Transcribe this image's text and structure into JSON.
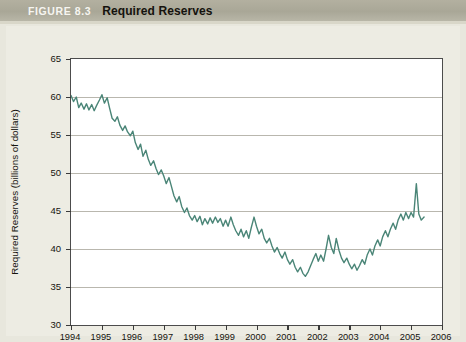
{
  "header": {
    "figure_number": "FIGURE 8.3",
    "title": "Required Reserves"
  },
  "chart_data": {
    "type": "line",
    "title": "Required Reserves",
    "xlabel": "Date",
    "ylabel": "Required Reserves (billions of dollars)",
    "xlim": [
      1994,
      2006
    ],
    "ylim": [
      30,
      65
    ],
    "xticks": [
      "1994",
      "1995",
      "1996",
      "1997",
      "1998",
      "1999",
      "2000",
      "2001",
      "2002",
      "2003",
      "2004",
      "2005",
      "2006"
    ],
    "yticks": [
      30,
      35,
      40,
      45,
      50,
      55,
      60,
      65
    ],
    "grid": true,
    "legend": "none",
    "line_color": "#4a8577",
    "series": [
      {
        "name": "Required Reserves",
        "x": [
          1994.0,
          1994.08,
          1994.17,
          1994.25,
          1994.33,
          1994.42,
          1994.5,
          1994.58,
          1994.67,
          1994.75,
          1994.83,
          1994.92,
          1995.0,
          1995.08,
          1995.17,
          1995.25,
          1995.33,
          1995.42,
          1995.5,
          1995.58,
          1995.67,
          1995.75,
          1995.83,
          1995.92,
          1996.0,
          1996.08,
          1996.17,
          1996.25,
          1996.33,
          1996.42,
          1996.5,
          1996.58,
          1996.67,
          1996.75,
          1996.83,
          1996.92,
          1997.0,
          1997.08,
          1997.17,
          1997.25,
          1997.33,
          1997.42,
          1997.5,
          1997.58,
          1997.67,
          1997.75,
          1997.83,
          1997.92,
          1998.0,
          1998.08,
          1998.17,
          1998.25,
          1998.33,
          1998.42,
          1998.5,
          1998.58,
          1998.67,
          1998.75,
          1998.83,
          1998.92,
          1999.0,
          1999.08,
          1999.17,
          1999.25,
          1999.33,
          1999.42,
          1999.5,
          1999.58,
          1999.67,
          1999.75,
          1999.83,
          1999.92,
          2000.0,
          2000.08,
          2000.17,
          2000.25,
          2000.33,
          2000.42,
          2000.5,
          2000.58,
          2000.67,
          2000.75,
          2000.83,
          2000.92,
          2001.0,
          2001.08,
          2001.17,
          2001.25,
          2001.33,
          2001.42,
          2001.5,
          2001.58,
          2001.67,
          2001.75,
          2001.83,
          2001.92,
          2002.0,
          2002.08,
          2002.17,
          2002.25,
          2002.33,
          2002.42,
          2002.5,
          2002.58,
          2002.67,
          2002.75,
          2002.83,
          2002.92,
          2003.0,
          2003.08,
          2003.17,
          2003.25,
          2003.33,
          2003.42,
          2003.5,
          2003.58,
          2003.67,
          2003.75,
          2003.83,
          2003.92,
          2004.0,
          2004.08,
          2004.17,
          2004.25,
          2004.33,
          2004.42,
          2004.5,
          2004.58,
          2004.67,
          2004.75,
          2004.83,
          2004.92,
          2005.0,
          2005.08,
          2005.17,
          2005.25,
          2005.33,
          2005.42
        ],
        "values": [
          60.2,
          59.4,
          60.0,
          58.6,
          59.2,
          58.4,
          59.1,
          58.3,
          59.0,
          58.2,
          58.9,
          59.6,
          60.3,
          59.2,
          59.9,
          58.5,
          57.2,
          56.8,
          57.4,
          56.3,
          55.6,
          56.2,
          55.4,
          54.9,
          55.5,
          54.0,
          53.1,
          53.8,
          52.2,
          53.0,
          51.8,
          51.0,
          51.6,
          50.6,
          49.8,
          50.4,
          49.6,
          48.6,
          49.4,
          48.2,
          47.0,
          46.2,
          46.9,
          45.6,
          44.8,
          45.4,
          44.4,
          43.8,
          44.4,
          43.6,
          44.3,
          43.2,
          44.0,
          43.3,
          44.1,
          43.4,
          44.2,
          43.5,
          44.0,
          43.0,
          43.8,
          43.0,
          44.2,
          43.2,
          42.4,
          41.8,
          42.6,
          41.6,
          42.4,
          41.4,
          42.8,
          44.2,
          43.0,
          42.0,
          42.6,
          41.4,
          40.8,
          41.4,
          40.4,
          39.6,
          40.2,
          39.4,
          38.8,
          39.6,
          38.6,
          38.0,
          38.6,
          37.6,
          37.0,
          37.6,
          36.8,
          36.4,
          37.0,
          37.8,
          38.6,
          39.4,
          38.4,
          39.2,
          38.4,
          40.0,
          41.8,
          40.2,
          39.4,
          41.4,
          39.8,
          38.8,
          38.2,
          38.8,
          38.0,
          37.4,
          38.0,
          37.2,
          37.8,
          38.6,
          38.0,
          39.2,
          40.0,
          39.2,
          40.4,
          41.2,
          40.4,
          41.6,
          42.4,
          41.6,
          42.6,
          43.4,
          42.6,
          43.8,
          44.6,
          43.8,
          44.8,
          44.0,
          44.8,
          44.2,
          48.6,
          44.6,
          43.8,
          44.2
        ]
      }
    ]
  },
  "axes": {
    "x_title": "Date",
    "y_title": "Required Reserves (billions of dollars)"
  }
}
